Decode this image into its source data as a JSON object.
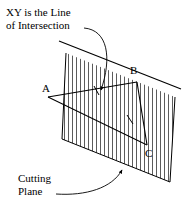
{
  "figure": {
    "background_color": "#ffffff",
    "line_color": "#000000",
    "annotations": {
      "top_line1": "XY is the Line",
      "top_line2": "of Intersection",
      "bottom_line1": "Cutting",
      "bottom_line2": "Plane"
    },
    "vertex_labels": {
      "a": "A",
      "b": "B",
      "c": "C"
    },
    "geometry": {
      "plane": {
        "name": "cutting-plane",
        "shape": "parallelogram",
        "corners": [
          [
            66,
            53
          ],
          [
            175,
            97
          ],
          [
            170,
            182
          ],
          [
            62,
            139
          ]
        ],
        "hatch": "vertical",
        "hatch_spacing_px": 4,
        "hatch_color": "#555555"
      },
      "intersection_line": {
        "name": "xy-line",
        "from": [
          60,
          42
        ],
        "to": [
          180,
          89
        ],
        "label": "XY"
      },
      "triangle": {
        "name": "triangle-abc",
        "vertices": {
          "A": [
            48,
            97
          ],
          "B": [
            137,
            82
          ],
          "C": [
            147,
            145
          ]
        },
        "pierce_points": {
          "X": [
            97,
            91
          ],
          "Y": [
            131,
            120
          ]
        }
      },
      "leader_top": {
        "name": "leader-intersection",
        "from": [
          84,
          28
        ],
        "to": [
          100,
          92
        ]
      },
      "leader_bottom": {
        "name": "leader-cutting-plane",
        "from": [
          58,
          193
        ],
        "to": [
          120,
          169
        ]
      }
    }
  }
}
